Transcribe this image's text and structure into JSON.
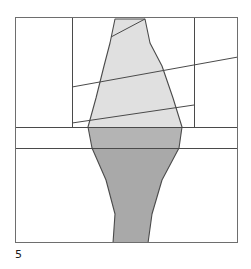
{
  "figure": {
    "caption": "5",
    "frame": {
      "x": 15,
      "y": 17,
      "width": 223,
      "height": 226
    },
    "colors": {
      "background": "#ffffff",
      "stroke": "#4a4a4a",
      "light_fill": "#e0e0e0",
      "mid_fill": "#d2d2d2",
      "dark_fill": "#a9a9a9",
      "caption_text": "#1a1a1a"
    },
    "elements": {
      "outer_frame": "rectangle-border",
      "vertical_divider_left_x": 72,
      "vertical_divider_right_x": 194,
      "horizontal_band_top_y": 127,
      "horizontal_band_bottom_y": 148,
      "slant_lines": [
        {
          "name": "upper-slant",
          "x1": 72,
          "y1": 87,
          "x2": 238,
          "y2": 58
        },
        {
          "name": "lower-slant",
          "x1": 72,
          "y1": 123,
          "x2": 194,
          "y2": 106
        }
      ],
      "silhouette": {
        "name": "tapered-vase-outline",
        "apex_left_x": 115,
        "apex_right_x": 145,
        "apex_y": 19,
        "widest_y": 127,
        "widest_left_x": 88,
        "widest_right_x": 182,
        "base_left_x": 113,
        "base_right_x": 148,
        "base_y": 243
      }
    }
  }
}
